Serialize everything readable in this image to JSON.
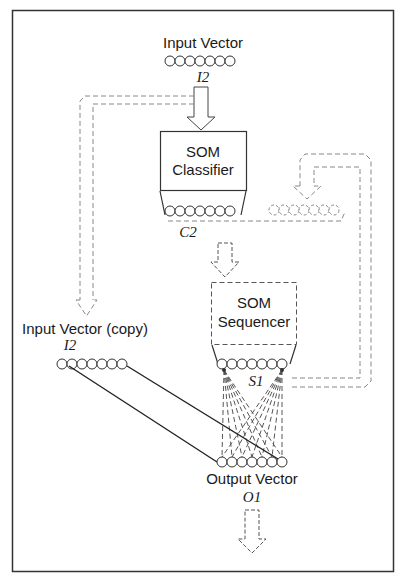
{
  "diagram": {
    "input_vector": {
      "label": "Input Vector",
      "symbol": "I2",
      "nodes": 7
    },
    "som_classifier": {
      "line1": "SOM",
      "line2": "Classifier",
      "symbol": "C2",
      "nodes": 7
    },
    "feedback_vector": {
      "nodes": 7
    },
    "som_sequencer": {
      "line1": "SOM",
      "line2": "Sequencer",
      "symbol": "S1",
      "nodes": 7
    },
    "input_vector_copy": {
      "label": "Input Vector (copy)",
      "symbol": "I2",
      "nodes": 7
    },
    "output_vector": {
      "label": "Output Vector",
      "symbol": "O1",
      "nodes": 7
    }
  }
}
